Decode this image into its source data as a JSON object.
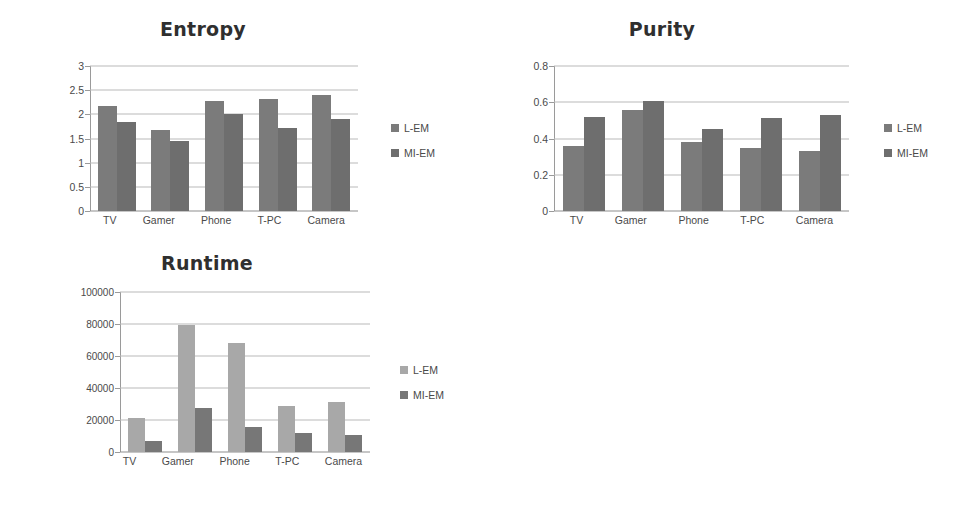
{
  "page": {
    "background": "#ffffff",
    "kind": "figure-with-three-bar-charts"
  },
  "palette": {
    "series1_default": "#7b7b7b",
    "series2_default": "#6e6e6e",
    "series1_runtime": "#a8a8a8",
    "series2_runtime": "#777777",
    "gridline": "#b9b9b9",
    "axis": "#9a9a9a",
    "text": "#4a4a4a",
    "title": "#2f2f2f"
  },
  "charts": {
    "entropy": {
      "title": "Entropy",
      "legend": [
        {
          "label": "L-EM",
          "color": "#7b7b7b"
        },
        {
          "label": "MI-EM",
          "color": "#6e6e6e"
        }
      ],
      "yticks": [
        "3",
        "2.5",
        "2",
        "1.5",
        "1",
        "0.5",
        "0"
      ],
      "xlabels": [
        "TV",
        "Gamer",
        "Phone",
        "T-PC",
        "Camera"
      ]
    },
    "purity": {
      "title": "Purity",
      "legend": [
        {
          "label": "L-EM",
          "color": "#7b7b7b"
        },
        {
          "label": "MI-EM",
          "color": "#6e6e6e"
        }
      ],
      "yticks": [
        "0.8",
        "0.6",
        "0.4",
        "0.2",
        "0"
      ],
      "xlabels": [
        "TV",
        "Gamer",
        "Phone",
        "T-PC",
        "Camera"
      ]
    },
    "runtime": {
      "title": "Runtime",
      "legend": [
        {
          "label": "L-EM",
          "color": "#a8a8a8"
        },
        {
          "label": "MI-EM",
          "color": "#777777"
        }
      ],
      "yticks": [
        "100000",
        "80000",
        "60000",
        "40000",
        "20000",
        "0"
      ],
      "xlabels": [
        "TV",
        "Gamer",
        "Phone",
        "T-PC",
        "Camera"
      ]
    }
  },
  "chart_data": [
    {
      "type": "bar",
      "title": "Entropy",
      "xlabel": "",
      "ylabel": "",
      "categories": [
        "TV",
        "Gamer",
        "Phone",
        "T-PC",
        "Camera"
      ],
      "series": [
        {
          "name": "L-EM",
          "values": [
            2.18,
            1.68,
            2.27,
            2.31,
            2.41
          ],
          "color": "#7b7b7b"
        },
        {
          "name": "MI-EM",
          "values": [
            1.85,
            1.44,
            2.01,
            1.71,
            1.9
          ],
          "color": "#6e6e6e"
        }
      ],
      "ylim": [
        0,
        3
      ],
      "ytick_values": [
        0,
        0.5,
        1,
        1.5,
        2,
        2.5,
        3
      ],
      "grid": true,
      "legend_position": "right"
    },
    {
      "type": "bar",
      "title": "Purity",
      "xlabel": "",
      "ylabel": "",
      "categories": [
        "TV",
        "Gamer",
        "Phone",
        "T-PC",
        "Camera"
      ],
      "series": [
        {
          "name": "L-EM",
          "values": [
            0.36,
            0.56,
            0.38,
            0.35,
            0.33
          ],
          "color": "#7b7b7b"
        },
        {
          "name": "MI-EM",
          "values": [
            0.52,
            0.605,
            0.45,
            0.515,
            0.53
          ],
          "color": "#6e6e6e"
        }
      ],
      "ylim": [
        0,
        0.8
      ],
      "ytick_values": [
        0,
        0.2,
        0.4,
        0.6,
        0.8
      ],
      "grid": true,
      "legend_position": "right"
    },
    {
      "type": "bar",
      "title": "Runtime",
      "xlabel": "",
      "ylabel": "",
      "categories": [
        "TV",
        "Gamer",
        "Phone",
        "T-PC",
        "Camera"
      ],
      "series": [
        {
          "name": "L-EM",
          "values": [
            21500,
            79500,
            68000,
            28500,
            31000
          ],
          "color": "#a8a8a8"
        },
        {
          "name": "MI-EM",
          "values": [
            7000,
            27500,
            15500,
            12000,
            10500
          ],
          "color": "#777777"
        }
      ],
      "ylim": [
        0,
        100000
      ],
      "ytick_values": [
        0,
        20000,
        40000,
        60000,
        80000,
        100000
      ],
      "grid": true,
      "legend_position": "right"
    }
  ]
}
